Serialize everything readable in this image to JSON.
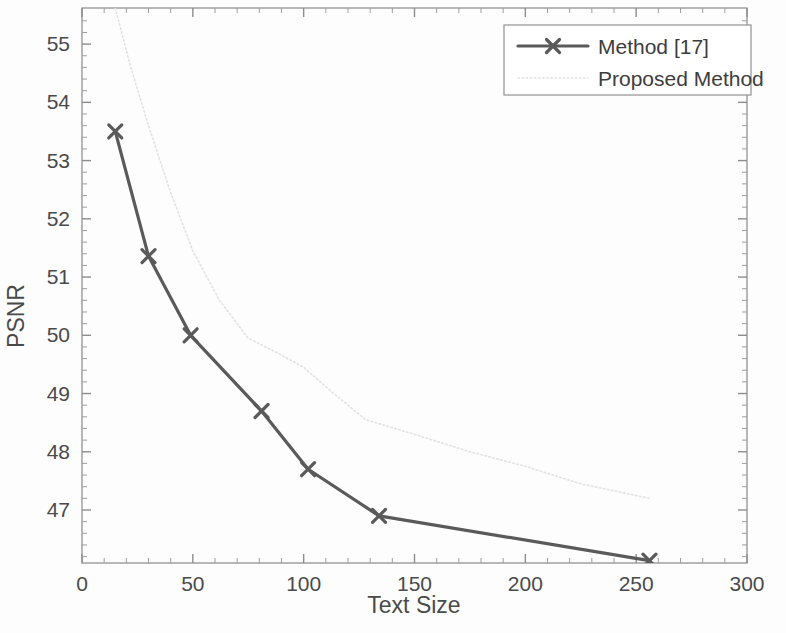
{
  "chart_data": {
    "type": "line",
    "title": "",
    "xlabel": "Text Size",
    "ylabel": "PSNR",
    "xlim": [
      0,
      300
    ],
    "ylim": [
      46.09,
      55.62
    ],
    "xticks": [
      "0",
      "50",
      "100",
      "150",
      "200",
      "250",
      "300"
    ],
    "xtick_values": [
      0,
      50,
      100,
      150,
      200,
      250,
      300
    ],
    "yticks": [
      "47",
      "48",
      "49",
      "50",
      "51",
      "52",
      "53",
      "54",
      "55"
    ],
    "ytick_values": [
      47,
      48,
      49,
      50,
      51,
      52,
      53,
      54,
      55
    ],
    "grid": false,
    "legend_position": "top-right",
    "series": [
      {
        "name": "Method [17]",
        "color": "#5a5a5a",
        "style": "solid",
        "marker": "x",
        "linewidth": 3.2,
        "x": [
          15,
          30,
          49,
          81,
          102,
          134,
          256
        ],
        "y": [
          53.5,
          51.36,
          50.0,
          48.7,
          47.7,
          46.9,
          46.13
        ]
      },
      {
        "name": "Proposed Method",
        "color": "#e2e2e2",
        "style": "dotted",
        "marker": "none",
        "linewidth": 1.6,
        "x": [
          15,
          22,
          30,
          40,
          50,
          62,
          75,
          88,
          100,
          112,
          128,
          150,
          175,
          200,
          225,
          256
        ],
        "y": [
          55.62,
          54.6,
          53.6,
          52.45,
          51.45,
          50.6,
          49.95,
          49.7,
          49.45,
          49.05,
          48.55,
          48.3,
          48.0,
          47.75,
          47.45,
          47.2
        ]
      }
    ]
  },
  "axes": {
    "x_label": "Text Size",
    "y_label": "PSNR"
  },
  "legend": {
    "entries": [
      {
        "label": "Method [17]"
      },
      {
        "label": "Proposed Method"
      }
    ]
  }
}
